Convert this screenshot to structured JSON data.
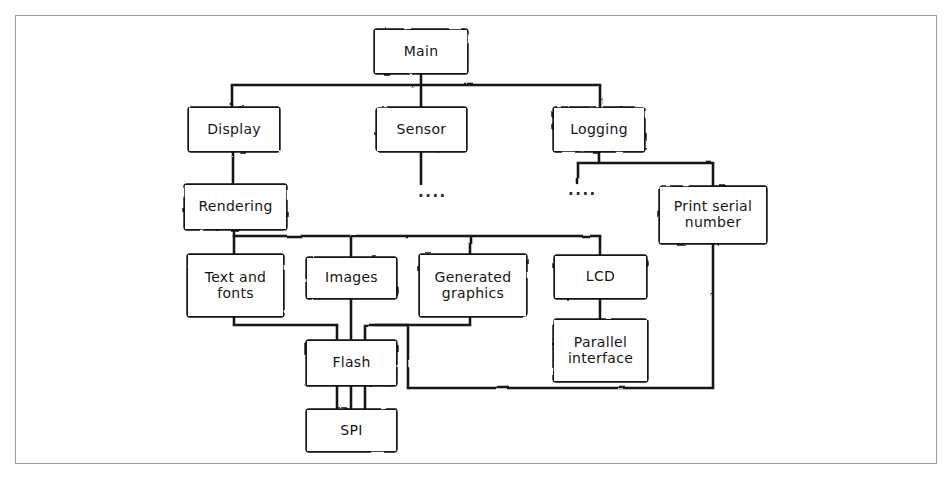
{
  "diagram": {
    "style": {
      "background": "#ffffff",
      "frame_border": "#9a9a9a",
      "ink": "#151515"
    },
    "nodes": [
      {
        "id": "main",
        "label": "Main",
        "x": 375,
        "y": 30,
        "w": 92,
        "h": 43
      },
      {
        "id": "display",
        "label": "Display",
        "x": 189,
        "y": 108,
        "w": 90,
        "h": 43
      },
      {
        "id": "sensor",
        "label": "Sensor",
        "x": 377,
        "y": 108,
        "w": 89,
        "h": 43
      },
      {
        "id": "logging",
        "label": "Logging",
        "x": 554,
        "y": 108,
        "w": 90,
        "h": 43
      },
      {
        "id": "rendering",
        "label": "Rendering",
        "x": 185,
        "y": 185,
        "w": 101,
        "h": 44
      },
      {
        "id": "print",
        "label": "Print serial\nnumber",
        "x": 660,
        "y": 187,
        "w": 106,
        "h": 56
      },
      {
        "id": "text",
        "label": "Text and\nfonts",
        "x": 188,
        "y": 255,
        "w": 95,
        "h": 61
      },
      {
        "id": "images",
        "label": "Images",
        "x": 307,
        "y": 258,
        "w": 89,
        "h": 40
      },
      {
        "id": "graphics",
        "label": "Generated\ngraphics",
        "x": 420,
        "y": 255,
        "w": 106,
        "h": 61
      },
      {
        "id": "lcd",
        "label": "LCD",
        "x": 555,
        "y": 256,
        "w": 91,
        "h": 42
      },
      {
        "id": "parallel",
        "label": "Parallel\ninterface",
        "x": 554,
        "y": 320,
        "w": 93,
        "h": 61
      },
      {
        "id": "flash",
        "label": "Flash",
        "x": 307,
        "y": 341,
        "w": 89,
        "h": 44
      },
      {
        "id": "spi",
        "label": "SPI",
        "x": 307,
        "y": 410,
        "w": 89,
        "h": 41
      }
    ],
    "ellipses": [
      {
        "id": "sensor-children",
        "label": "....",
        "x": 418,
        "y": 185
      },
      {
        "id": "logging-children",
        "label": "....",
        "x": 568,
        "y": 183
      }
    ],
    "edges": [
      {
        "id": "main-to-display",
        "from": "main",
        "to": "display"
      },
      {
        "id": "main-to-sensor",
        "from": "main",
        "to": "sensor"
      },
      {
        "id": "main-to-logging",
        "from": "main",
        "to": "logging"
      },
      {
        "id": "display-to-rendering",
        "from": "display",
        "to": "rendering"
      },
      {
        "id": "sensor-to-ellipsis",
        "from": "sensor",
        "to": "sensor-children"
      },
      {
        "id": "logging-to-ellipsis",
        "from": "logging",
        "to": "logging-children"
      },
      {
        "id": "logging-to-print",
        "from": "logging",
        "to": "print"
      },
      {
        "id": "rendering-to-text",
        "from": "rendering",
        "to": "text"
      },
      {
        "id": "rendering-to-images",
        "from": "rendering",
        "to": "images"
      },
      {
        "id": "rendering-to-graphics",
        "from": "rendering",
        "to": "graphics"
      },
      {
        "id": "rendering-to-lcd",
        "from": "rendering",
        "to": "lcd"
      },
      {
        "id": "text-to-flash",
        "from": "text",
        "to": "flash"
      },
      {
        "id": "images-to-flash",
        "from": "images",
        "to": "flash"
      },
      {
        "id": "graphics-to-flash",
        "from": "graphics",
        "to": "flash"
      },
      {
        "id": "flash-to-spi",
        "from": "flash",
        "to": "spi"
      },
      {
        "id": "lcd-to-parallel",
        "from": "lcd",
        "to": "parallel"
      },
      {
        "id": "flash-to-print-serial",
        "from": "flash",
        "to": "print"
      }
    ]
  }
}
